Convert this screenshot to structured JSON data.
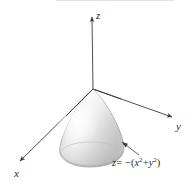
{
  "figure": {
    "background_color": "#ffffff",
    "line_color": "#3a3a3a",
    "surface": {
      "name": "paraboloid",
      "equation_text": "z = -(x^2 + y^2)",
      "apex": {
        "x": 93,
        "y": 89
      },
      "fill_light": "#f2f2f2",
      "fill_mid": "#dcdcdc",
      "fill_dark": "#c2c2c2",
      "outline_color": "#8c8c8c"
    },
    "axes": [
      {
        "id": "z",
        "label": "z",
        "direction": "up",
        "origin": {
          "x": 93,
          "y": 89
        },
        "tip": {
          "x": 92,
          "y": 15
        }
      },
      {
        "id": "y",
        "label": "y",
        "direction": "down-right",
        "origin": {
          "x": 93,
          "y": 89
        },
        "tip": {
          "x": 174,
          "y": 118
        }
      },
      {
        "id": "x",
        "label": "x",
        "direction": "down-left",
        "origin": {
          "x": 93,
          "y": 89
        },
        "tip": {
          "x": 18,
          "y": 163
        }
      }
    ],
    "annotation": {
      "id": "equation-callout",
      "equation": {
        "lhs": "z",
        "relation": "= −",
        "open_paren": "(",
        "term1_base": "x",
        "term1_exp": "2",
        "plus": "+",
        "term2_base": "y",
        "term2_exp": "2",
        "close_paren": ")"
      },
      "leader_from": {
        "x": 121,
        "y": 142
      },
      "leader_to": {
        "x": 139,
        "y": 155
      }
    }
  }
}
